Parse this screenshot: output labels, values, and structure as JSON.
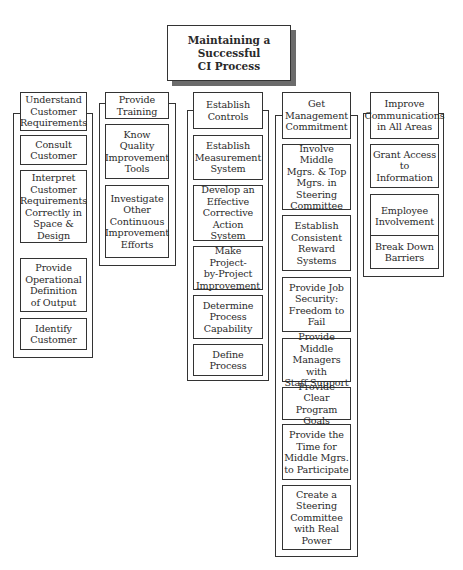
{
  "title": "Maintaining a\nSuccessful\nCI Process",
  "columns": [
    {
      "header": "Understand\nCustomer\nRequirements",
      "items": [
        "Consult\nCustomer",
        "Interpret\nCustomer\nRequirements\nCorrectly in\nSpace &\nDesign",
        "Provide\nOperational\nDefinition\nof Output",
        "Identify\nCustomer"
      ]
    },
    {
      "header": "Provide\nTraining",
      "items": [
        "Know\nQuality\nImprovement\nTools",
        "Investigate\nOther\nContinuous\nImprovement\nEfforts"
      ]
    },
    {
      "header": "Establish\nControls",
      "items": [
        "Establish\nMeasurement\nSystem",
        "Develop an\nEffective\nCorrective\nAction System",
        "Make Project-\nby-Project\nImprovement",
        "Determine\nProcess\nCapability",
        "Define\nProcess"
      ]
    },
    {
      "header": "Get\nManagement\nCommitment",
      "items": [
        "Involve Middle\nMgrs. & Top\nMgrs. in\nSteering\nCommittee",
        "Establish\nConsistent\nReward\nSystems",
        "Provide Job\nSecurity:\nFreedom to\nFail",
        "Provide Middle\nManagers with\nStaff Support",
        "Provide Clear\nProgram Goals",
        "Provide the\nTime for\nMiddle Mgrs.\nto Participate",
        "Create a\nSteering\nCommittee\nwith Real\nPower"
      ]
    },
    {
      "header": "Improve\nCommunications\nin All Areas",
      "items": [
        "Grant Access\nto\nInformation",
        "Employee\nInvolvement",
        "Break Down\nBarriers"
      ]
    }
  ]
}
